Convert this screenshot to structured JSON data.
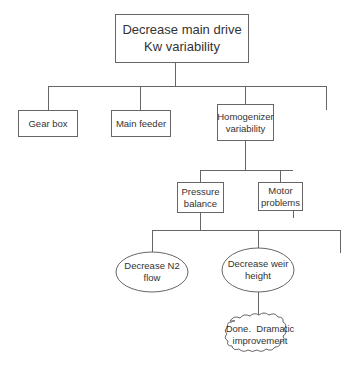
{
  "diagram": {
    "type": "tree",
    "nodes": [
      {
        "id": "root",
        "shape": "box",
        "label_lines": [
          "Decrease main drive",
          "Kw variability"
        ]
      },
      {
        "id": "gearbox",
        "shape": "box",
        "label_lines": [
          "Gear box"
        ]
      },
      {
        "id": "mainfeeder",
        "shape": "box",
        "label_lines": [
          "Main feeder"
        ]
      },
      {
        "id": "homogenizer",
        "shape": "box",
        "label_lines": [
          "Homogenizer",
          "variability"
        ]
      },
      {
        "id": "pressure",
        "shape": "box",
        "label_lines": [
          "Pressure",
          "balance"
        ]
      },
      {
        "id": "motor",
        "shape": "box",
        "label_lines": [
          "Motor",
          "problems"
        ]
      },
      {
        "id": "n2",
        "shape": "ellipse",
        "label_lines": [
          "Decrease N2",
          "flow"
        ]
      },
      {
        "id": "weir",
        "shape": "ellipse",
        "label_lines": [
          "Decrease weir",
          "height"
        ]
      },
      {
        "id": "done",
        "shape": "cloud",
        "label_lines": [
          "Done.  Dramatic",
          "improvement"
        ]
      }
    ],
    "edges": [
      [
        "root",
        "gearbox"
      ],
      [
        "root",
        "mainfeeder"
      ],
      [
        "root",
        "homogenizer"
      ],
      [
        "root",
        "unnamed-branch-1"
      ],
      [
        "homogenizer",
        "pressure"
      ],
      [
        "homogenizer",
        "motor"
      ],
      [
        "pressure",
        "n2"
      ],
      [
        "pressure",
        "weir"
      ],
      [
        "pressure",
        "unnamed-branch-2"
      ],
      [
        "weir",
        "done"
      ]
    ],
    "colors": {
      "line": "#666666",
      "text": "#333333",
      "background": "#ffffff"
    }
  }
}
